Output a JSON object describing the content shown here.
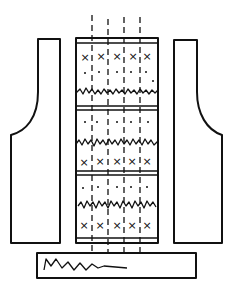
{
  "diagram": {
    "pieces": [
      {
        "name": "left-front-piece"
      },
      {
        "name": "back-panel",
        "bands": 3,
        "motif_columns": 5
      },
      {
        "name": "right-front-piece"
      },
      {
        "name": "bottom-band"
      }
    ],
    "symbols": {
      "cross": "×",
      "dot": "·"
    },
    "colors": {
      "line": "#111111",
      "background": "#ffffff"
    }
  }
}
